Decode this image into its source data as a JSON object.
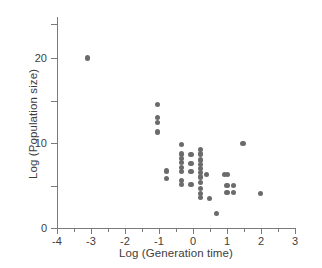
{
  "chart_data": {
    "type": "scatter",
    "title": "",
    "xlabel": "Log (Generation time)",
    "ylabel": "Log (Population size)",
    "xlim": [
      -4,
      3
    ],
    "ylim": [
      0,
      24.8
    ],
    "grid": false,
    "legend": null,
    "marker_color": "#6b6b6b",
    "axis_color": "#7a7a7a",
    "xticks": [
      -4,
      -3,
      -2,
      -1,
      0,
      1,
      2,
      3
    ],
    "xtick_labels": [
      "-4",
      "-3",
      "-2",
      "-1",
      "0",
      "1",
      "2",
      "3"
    ],
    "xminor_ticks": [
      -3.5,
      -2.5,
      -1.5,
      -0.5,
      0.5,
      1.5,
      2.5
    ],
    "yticks": [
      0,
      10,
      20
    ],
    "ytick_labels": [
      "0",
      "10",
      "20"
    ],
    "yminor_ticks": [
      5,
      15,
      24
    ],
    "points": [
      {
        "x": -3.1,
        "y": 20.0
      },
      {
        "x": -1.05,
        "y": 14.5
      },
      {
        "x": -1.05,
        "y": 13.0
      },
      {
        "x": -1.05,
        "y": 12.4
      },
      {
        "x": -1.05,
        "y": 11.3
      },
      {
        "x": -0.78,
        "y": 6.7
      },
      {
        "x": -0.78,
        "y": 5.8
      },
      {
        "x": -0.33,
        "y": 9.8
      },
      {
        "x": -0.33,
        "y": 8.7
      },
      {
        "x": -0.33,
        "y": 8.2
      },
      {
        "x": -0.33,
        "y": 7.7
      },
      {
        "x": -0.33,
        "y": 7.1
      },
      {
        "x": -0.33,
        "y": 6.6
      },
      {
        "x": -0.33,
        "y": 5.6
      },
      {
        "x": -0.33,
        "y": 5.1
      },
      {
        "x": -0.06,
        "y": 8.6
      },
      {
        "x": -0.06,
        "y": 7.6
      },
      {
        "x": -0.06,
        "y": 6.6
      },
      {
        "x": -0.06,
        "y": 5.1
      },
      {
        "x": 0.22,
        "y": 9.2
      },
      {
        "x": 0.22,
        "y": 8.7
      },
      {
        "x": 0.22,
        "y": 8.0
      },
      {
        "x": 0.22,
        "y": 7.5
      },
      {
        "x": 0.22,
        "y": 7.0
      },
      {
        "x": 0.22,
        "y": 6.5
      },
      {
        "x": 0.22,
        "y": 6.0
      },
      {
        "x": 0.22,
        "y": 5.4
      },
      {
        "x": 0.22,
        "y": 4.6
      },
      {
        "x": 0.22,
        "y": 4.1
      },
      {
        "x": 0.22,
        "y": 3.6
      },
      {
        "x": 0.4,
        "y": 6.3
      },
      {
        "x": 0.48,
        "y": 3.5
      },
      {
        "x": 0.7,
        "y": 1.7
      },
      {
        "x": 0.93,
        "y": 6.3
      },
      {
        "x": 1.02,
        "y": 6.3
      },
      {
        "x": 1.0,
        "y": 5.0
      },
      {
        "x": 1.19,
        "y": 5.0
      },
      {
        "x": 1.0,
        "y": 4.2
      },
      {
        "x": 1.19,
        "y": 4.2
      },
      {
        "x": 1.47,
        "y": 9.9
      },
      {
        "x": 1.98,
        "y": 4.1
      }
    ]
  }
}
